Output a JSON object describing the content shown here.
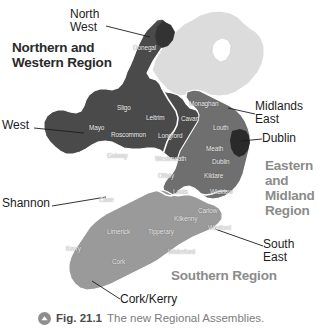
{
  "figure": {
    "caption_marker_icon": "chevron-up-circle-icon",
    "caption_number": "Fig. 21.1",
    "caption_text": "The new Regional Assemblies."
  },
  "map": {
    "title": "The new Regional Assemblies",
    "regions": [
      {
        "key": "northern_western",
        "label": "Northern and\nWestern Region",
        "text_color": "#2a2a2a",
        "fill": "#4a4a4a"
      },
      {
        "key": "eastern_midland",
        "label": "Eastern\nand\nMidland\nRegion",
        "text_color": "#8b8b8b",
        "fill": "#6f6f6f"
      },
      {
        "key": "southern",
        "label": "Southern Region",
        "text_color": "#8b8b8b",
        "fill": "#9a9a9a"
      }
    ],
    "callouts": [
      {
        "key": "north_west",
        "label": "North\nWest"
      },
      {
        "key": "west",
        "label": "West"
      },
      {
        "key": "shannon",
        "label": "Shannon"
      },
      {
        "key": "midlands_east",
        "label": "Midlands\nEast"
      },
      {
        "key": "dublin",
        "label": "Dublin"
      },
      {
        "key": "south_east",
        "label": "South\nEast"
      },
      {
        "key": "cork_kerry",
        "label": "Cork/Kerry"
      }
    ],
    "counties": [
      {
        "key": "donegal",
        "label": "Donegal"
      },
      {
        "key": "sligo",
        "label": "Sligo"
      },
      {
        "key": "leitrim",
        "label": "Leitrim"
      },
      {
        "key": "monaghan",
        "label": "Monaghan"
      },
      {
        "key": "cavan",
        "label": "Cavan"
      },
      {
        "key": "mayo",
        "label": "Mayo"
      },
      {
        "key": "roscommon",
        "label": "Roscommon"
      },
      {
        "key": "longford",
        "label": "Longford"
      },
      {
        "key": "louth",
        "label": "Louth"
      },
      {
        "key": "galway",
        "label": "Galway"
      },
      {
        "key": "westmeath",
        "label": "Westmeath"
      },
      {
        "key": "meath",
        "label": "Meath"
      },
      {
        "key": "offaly",
        "label": "Offaly"
      },
      {
        "key": "dublin",
        "label": "Dublin"
      },
      {
        "key": "kildare",
        "label": "Kildare"
      },
      {
        "key": "laois",
        "label": "Laois"
      },
      {
        "key": "wicklow",
        "label": "Wicklow"
      },
      {
        "key": "clare",
        "label": "Clare"
      },
      {
        "key": "carlow",
        "label": "Carlow"
      },
      {
        "key": "kilkenny",
        "label": "Kilkenny"
      },
      {
        "key": "limerick",
        "label": "Limerick"
      },
      {
        "key": "tipperary",
        "label": "Tipperary"
      },
      {
        "key": "wexford",
        "label": "Wexford"
      },
      {
        "key": "kerry",
        "label": "Kerry"
      },
      {
        "key": "waterford",
        "label": "Waterford"
      },
      {
        "key": "cork",
        "label": "Cork"
      }
    ],
    "colors": {
      "northern_western_fill": "#4a4a4a",
      "eastern_midland_fill": "#6f6f6f",
      "southern_fill": "#9a9a9a",
      "northern_ireland_fill": "#dcdcdc",
      "border_white": "#ffffff",
      "lough_neagh": "#ffffff",
      "background": "#ffffff"
    }
  }
}
